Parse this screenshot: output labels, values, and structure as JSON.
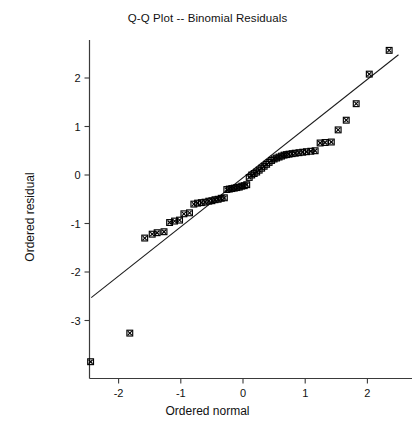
{
  "chart_data": {
    "type": "scatter",
    "title": "Q-Q Plot -- Binomial Residuals",
    "xlabel": "Ordered normal",
    "ylabel": "Ordered residual",
    "xlim": [
      -2.55,
      2.62
    ],
    "ylim": [
      -3.85,
      2.8
    ],
    "xticks": [
      -2,
      -1,
      0,
      1,
      2
    ],
    "xtick_labels": [
      "-2",
      "-1",
      "0",
      "1",
      "2"
    ],
    "yticks": [
      2,
      1,
      0,
      -1,
      -2,
      -3
    ],
    "ytick_labels": [
      "2",
      "1",
      "0",
      "-1",
      "-2",
      "-3"
    ],
    "grid": false,
    "legend": null,
    "marker": "x-in-square",
    "marker_color": "#000000",
    "reference_line": {
      "label": "identity line",
      "x": [
        -2.44,
        2.5
      ],
      "y": [
        -2.53,
        2.48
      ],
      "color": "#1a1a1a"
    },
    "series": [
      {
        "name": "Binomial residuals",
        "points": [
          [
            -2.45,
            -3.85
          ],
          [
            -1.82,
            -3.26
          ],
          [
            -1.58,
            -1.3
          ],
          [
            -1.46,
            -1.22
          ],
          [
            -1.38,
            -1.19
          ],
          [
            -1.27,
            -1.17
          ],
          [
            -1.18,
            -0.98
          ],
          [
            -1.1,
            -0.95
          ],
          [
            -1.02,
            -0.93
          ],
          [
            -0.95,
            -0.8
          ],
          [
            -0.86,
            -0.78
          ],
          [
            -0.79,
            -0.6
          ],
          [
            -0.73,
            -0.58
          ],
          [
            -0.67,
            -0.57
          ],
          [
            -0.61,
            -0.56
          ],
          [
            -0.55,
            -0.54
          ],
          [
            -0.5,
            -0.53
          ],
          [
            -0.45,
            -0.51
          ],
          [
            -0.4,
            -0.5
          ],
          [
            -0.35,
            -0.48
          ],
          [
            -0.3,
            -0.47
          ],
          [
            -0.26,
            -0.3
          ],
          [
            -0.22,
            -0.29
          ],
          [
            -0.18,
            -0.28
          ],
          [
            -0.14,
            -0.27
          ],
          [
            -0.1,
            -0.26
          ],
          [
            -0.06,
            -0.25
          ],
          [
            -0.02,
            -0.23
          ],
          [
            0.02,
            -0.22
          ],
          [
            0.06,
            -0.2
          ],
          [
            0.1,
            -0.05
          ],
          [
            0.14,
            0.0
          ],
          [
            0.18,
            0.03
          ],
          [
            0.22,
            0.06
          ],
          [
            0.26,
            0.1
          ],
          [
            0.3,
            0.14
          ],
          [
            0.34,
            0.18
          ],
          [
            0.38,
            0.22
          ],
          [
            0.42,
            0.26
          ],
          [
            0.46,
            0.3
          ],
          [
            0.5,
            0.33
          ],
          [
            0.54,
            0.35
          ],
          [
            0.58,
            0.37
          ],
          [
            0.62,
            0.39
          ],
          [
            0.66,
            0.41
          ],
          [
            0.7,
            0.42
          ],
          [
            0.74,
            0.43
          ],
          [
            0.79,
            0.44
          ],
          [
            0.84,
            0.45
          ],
          [
            0.9,
            0.46
          ],
          [
            0.96,
            0.47
          ],
          [
            1.02,
            0.48
          ],
          [
            1.09,
            0.49
          ],
          [
            1.16,
            0.5
          ],
          [
            1.24,
            0.66
          ],
          [
            1.32,
            0.67
          ],
          [
            1.42,
            0.68
          ],
          [
            1.53,
            0.93
          ],
          [
            1.66,
            1.13
          ],
          [
            1.82,
            1.47
          ],
          [
            2.03,
            2.08
          ],
          [
            2.35,
            2.57
          ]
        ]
      }
    ]
  },
  "figure": {
    "background_color": "#ffffff",
    "axis_color": "#3a3a3a"
  }
}
